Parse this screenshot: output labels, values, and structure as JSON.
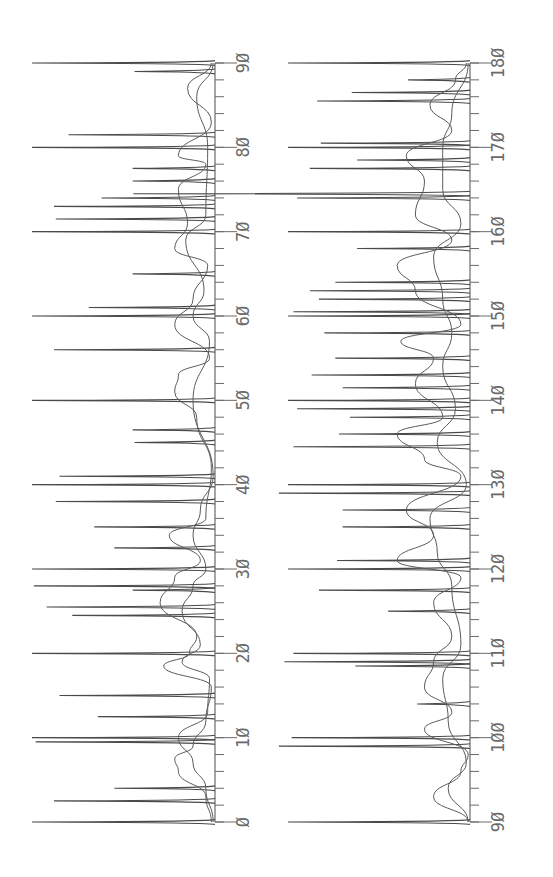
{
  "chart_data": [
    {
      "type": "line",
      "title": "",
      "orientation": "rotated-90-ccw",
      "xlabel": "",
      "ylabel": "",
      "xlim": [
        0,
        90
      ],
      "xticks": [
        0,
        10,
        20,
        30,
        40,
        50,
        60,
        70,
        80,
        90
      ],
      "tick_labels": [
        "Ø",
        "1Ø",
        "2Ø",
        "3Ø",
        "4Ø",
        "5Ø",
        "6Ø",
        "7Ø",
        "8Ø",
        "9Ø"
      ],
      "minor_tick_step": 2,
      "grid": false,
      "legend": null,
      "series": [
        {
          "name": "stick peaks",
          "style": "stick",
          "points": [
            {
              "x": 0.0,
              "y": 1.0
            },
            {
              "x": 2.5,
              "y": 0.88
            },
            {
              "x": 4.0,
              "y": 0.55
            },
            {
              "x": 9.5,
              "y": 0.98
            },
            {
              "x": 10.0,
              "y": 1.0
            },
            {
              "x": 12.5,
              "y": 0.64
            },
            {
              "x": 15.0,
              "y": 0.85
            },
            {
              "x": 20.0,
              "y": 1.0
            },
            {
              "x": 24.5,
              "y": 0.78
            },
            {
              "x": 25.5,
              "y": 0.92
            },
            {
              "x": 27.5,
              "y": 0.45
            },
            {
              "x": 28.0,
              "y": 0.99
            },
            {
              "x": 30.0,
              "y": 1.0
            },
            {
              "x": 32.5,
              "y": 0.55
            },
            {
              "x": 35.0,
              "y": 0.66
            },
            {
              "x": 38.0,
              "y": 0.87
            },
            {
              "x": 40.0,
              "y": 1.0
            },
            {
              "x": 41.0,
              "y": 0.85
            },
            {
              "x": 45.0,
              "y": 0.44
            },
            {
              "x": 46.5,
              "y": 0.45
            },
            {
              "x": 50.0,
              "y": 1.0
            },
            {
              "x": 56.0,
              "y": 0.88
            },
            {
              "x": 60.0,
              "y": 1.0
            },
            {
              "x": 61.0,
              "y": 0.69
            },
            {
              "x": 65.0,
              "y": 0.45
            },
            {
              "x": 70.0,
              "y": 1.0
            },
            {
              "x": 71.5,
              "y": 0.87
            },
            {
              "x": 73.0,
              "y": 0.88
            },
            {
              "x": 74.0,
              "y": 0.62
            },
            {
              "x": 76.0,
              "y": 0.45
            },
            {
              "x": 77.5,
              "y": 0.45
            },
            {
              "x": 80.0,
              "y": 1.0
            },
            {
              "x": 81.5,
              "y": 0.8
            },
            {
              "x": 89.0,
              "y": 0.44
            },
            {
              "x": 90.0,
              "y": 1.0
            }
          ]
        },
        {
          "name": "broad envelope A",
          "style": "envelope",
          "points": [
            {
              "x": 0,
              "y": 0.02
            },
            {
              "x": 3,
              "y": 0.05
            },
            {
              "x": 6,
              "y": 0.2
            },
            {
              "x": 7.5,
              "y": 0.22
            },
            {
              "x": 9,
              "y": 0.12
            },
            {
              "x": 12,
              "y": 0.05
            },
            {
              "x": 16,
              "y": 0.02
            },
            {
              "x": 18.5,
              "y": 0.28
            },
            {
              "x": 20,
              "y": 0.14
            },
            {
              "x": 22,
              "y": 0.1
            },
            {
              "x": 26,
              "y": 0.3
            },
            {
              "x": 29,
              "y": 0.22
            },
            {
              "x": 31,
              "y": 0.08
            },
            {
              "x": 34,
              "y": 0.25
            },
            {
              "x": 36,
              "y": 0.05
            },
            {
              "x": 42,
              "y": 0.02
            },
            {
              "x": 48,
              "y": 0.1
            },
            {
              "x": 51,
              "y": 0.22
            },
            {
              "x": 53,
              "y": 0.2
            },
            {
              "x": 55,
              "y": 0.03
            },
            {
              "x": 59,
              "y": 0.22
            },
            {
              "x": 62,
              "y": 0.12
            },
            {
              "x": 66,
              "y": 0.04
            },
            {
              "x": 68,
              "y": 0.22
            },
            {
              "x": 71,
              "y": 0.15
            },
            {
              "x": 75,
              "y": 0.2
            },
            {
              "x": 78,
              "y": 0.05
            },
            {
              "x": 79,
              "y": 0.2
            },
            {
              "x": 83,
              "y": 0.02
            },
            {
              "x": 87,
              "y": 0.15
            },
            {
              "x": 90,
              "y": 0.02
            }
          ]
        },
        {
          "name": "broad envelope B",
          "style": "envelope",
          "points": [
            {
              "x": 0,
              "y": 0.01
            },
            {
              "x": 4,
              "y": 0.05
            },
            {
              "x": 7,
              "y": 0.12
            },
            {
              "x": 10,
              "y": 0.2
            },
            {
              "x": 13,
              "y": 0.04
            },
            {
              "x": 17,
              "y": 0.03
            },
            {
              "x": 19,
              "y": 0.18
            },
            {
              "x": 21,
              "y": 0.08
            },
            {
              "x": 25,
              "y": 0.18
            },
            {
              "x": 28,
              "y": 0.12
            },
            {
              "x": 30,
              "y": 0.05
            },
            {
              "x": 34,
              "y": 0.12
            },
            {
              "x": 37,
              "y": 0.08
            },
            {
              "x": 41,
              "y": 0.01
            },
            {
              "x": 50,
              "y": 0.12
            },
            {
              "x": 57,
              "y": 0.03
            },
            {
              "x": 60,
              "y": 0.12
            },
            {
              "x": 63,
              "y": 0.06
            },
            {
              "x": 69,
              "y": 0.16
            },
            {
              "x": 72,
              "y": 0.05
            },
            {
              "x": 80,
              "y": 0.04
            },
            {
              "x": 86,
              "y": 0.1
            },
            {
              "x": 90,
              "y": 0.01
            }
          ]
        }
      ]
    },
    {
      "type": "line",
      "title": "",
      "orientation": "rotated-90-ccw",
      "xlabel": "",
      "ylabel": "",
      "xlim": [
        90,
        180
      ],
      "xticks": [
        90,
        100,
        110,
        120,
        130,
        140,
        150,
        160,
        170,
        180
      ],
      "tick_labels": [
        "9Ø",
        "1ØØ",
        "11Ø",
        "12Ø",
        "13Ø",
        "14Ø",
        "15Ø",
        "16Ø",
        "17Ø",
        "18Ø"
      ],
      "minor_tick_step": 2,
      "grid": false,
      "legend": null,
      "series": [
        {
          "name": "stick peaks",
          "style": "stick",
          "points": [
            {
              "x": 90.0,
              "y": 1.0
            },
            {
              "x": 99.0,
              "y": 1.05
            },
            {
              "x": 100.0,
              "y": 0.98
            },
            {
              "x": 104.0,
              "y": 0.29
            },
            {
              "x": 108.5,
              "y": 0.63
            },
            {
              "x": 109.0,
              "y": 1.02
            },
            {
              "x": 110.0,
              "y": 0.97
            },
            {
              "x": 115.0,
              "y": 0.45
            },
            {
              "x": 117.5,
              "y": 0.83
            },
            {
              "x": 120.0,
              "y": 1.0
            },
            {
              "x": 121.0,
              "y": 0.73
            },
            {
              "x": 125.0,
              "y": 0.7
            },
            {
              "x": 127.0,
              "y": 0.7
            },
            {
              "x": 129.0,
              "y": 1.05
            },
            {
              "x": 130.0,
              "y": 1.0
            },
            {
              "x": 134.5,
              "y": 0.97
            },
            {
              "x": 136.0,
              "y": 0.72
            },
            {
              "x": 138.0,
              "y": 0.66
            },
            {
              "x": 139.0,
              "y": 0.95
            },
            {
              "x": 140.0,
              "y": 1.0
            },
            {
              "x": 141.5,
              "y": 0.7
            },
            {
              "x": 143.0,
              "y": 0.87
            },
            {
              "x": 145.0,
              "y": 0.74
            },
            {
              "x": 148.0,
              "y": 0.8
            },
            {
              "x": 150.0,
              "y": 1.0
            },
            {
              "x": 150.5,
              "y": 0.97
            },
            {
              "x": 152.0,
              "y": 0.83
            },
            {
              "x": 153.0,
              "y": 0.88
            },
            {
              "x": 154.0,
              "y": 0.74
            },
            {
              "x": 158.0,
              "y": 0.62
            },
            {
              "x": 160.0,
              "y": 1.0
            },
            {
              "x": 164.0,
              "y": 0.95
            },
            {
              "x": 164.5,
              "y": 1.85
            },
            {
              "x": 167.5,
              "y": 0.88
            },
            {
              "x": 168.5,
              "y": 0.62
            },
            {
              "x": 170.0,
              "y": 1.0
            },
            {
              "x": 170.5,
              "y": 0.82
            },
            {
              "x": 175.5,
              "y": 0.84
            },
            {
              "x": 176.5,
              "y": 0.65
            },
            {
              "x": 178.0,
              "y": 0.34
            },
            {
              "x": 180.0,
              "y": 1.0
            }
          ]
        },
        {
          "name": "broad envelope A",
          "style": "envelope",
          "points": [
            {
              "x": 90,
              "y": 0.01
            },
            {
              "x": 93,
              "y": 0.2
            },
            {
              "x": 96,
              "y": 0.05
            },
            {
              "x": 98,
              "y": 0.01
            },
            {
              "x": 101,
              "y": 0.25
            },
            {
              "x": 103,
              "y": 0.1
            },
            {
              "x": 106,
              "y": 0.25
            },
            {
              "x": 109,
              "y": 0.2
            },
            {
              "x": 112,
              "y": 0.1
            },
            {
              "x": 116,
              "y": 0.2
            },
            {
              "x": 119,
              "y": 0.05
            },
            {
              "x": 121,
              "y": 0.4
            },
            {
              "x": 124,
              "y": 0.2
            },
            {
              "x": 127,
              "y": 0.35
            },
            {
              "x": 131,
              "y": 0.05
            },
            {
              "x": 133,
              "y": 0.25
            },
            {
              "x": 136,
              "y": 0.4
            },
            {
              "x": 138,
              "y": 0.15
            },
            {
              "x": 142,
              "y": 0.3
            },
            {
              "x": 145,
              "y": 0.2
            },
            {
              "x": 147,
              "y": 0.38
            },
            {
              "x": 149,
              "y": 0.05
            },
            {
              "x": 153,
              "y": 0.3
            },
            {
              "x": 156,
              "y": 0.4
            },
            {
              "x": 159,
              "y": 0.1
            },
            {
              "x": 162,
              "y": 0.3
            },
            {
              "x": 166,
              "y": 0.25
            },
            {
              "x": 169,
              "y": 0.35
            },
            {
              "x": 172,
              "y": 0.1
            },
            {
              "x": 175,
              "y": 0.22
            },
            {
              "x": 178,
              "y": 0.08
            },
            {
              "x": 180,
              "y": 0.02
            }
          ]
        },
        {
          "name": "broad envelope B",
          "style": "envelope",
          "points": [
            {
              "x": 90,
              "y": 0.01
            },
            {
              "x": 94,
              "y": 0.12
            },
            {
              "x": 97,
              "y": 0.02
            },
            {
              "x": 102,
              "y": 0.12
            },
            {
              "x": 107,
              "y": 0.15
            },
            {
              "x": 111,
              "y": 0.05
            },
            {
              "x": 118,
              "y": 0.1
            },
            {
              "x": 122,
              "y": 0.18
            },
            {
              "x": 126,
              "y": 0.22
            },
            {
              "x": 130,
              "y": 0.02
            },
            {
              "x": 135,
              "y": 0.18
            },
            {
              "x": 139,
              "y": 0.08
            },
            {
              "x": 144,
              "y": 0.15
            },
            {
              "x": 148,
              "y": 0.1
            },
            {
              "x": 152,
              "y": 0.15
            },
            {
              "x": 157,
              "y": 0.2
            },
            {
              "x": 161,
              "y": 0.05
            },
            {
              "x": 165,
              "y": 0.15
            },
            {
              "x": 170,
              "y": 0.15
            },
            {
              "x": 174,
              "y": 0.1
            },
            {
              "x": 180,
              "y": 0.01
            }
          ]
        }
      ]
    }
  ],
  "panels": [
    {
      "baseline_px": 215,
      "top_px": 32,
      "axis_start_px": 822,
      "axis_end_px": 63
    },
    {
      "baseline_px": 470,
      "top_px": 288,
      "axis_start_px": 822,
      "axis_end_px": 63
    }
  ],
  "colors": {
    "ink": "#4a4a4a",
    "axis": "#6a6a6a",
    "background": "#ffffff"
  }
}
